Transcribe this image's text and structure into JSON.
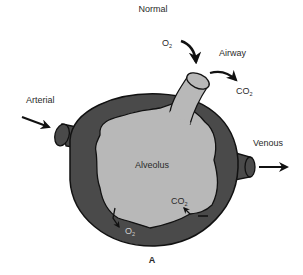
{
  "diagram": {
    "title": "Normal",
    "panel_label": "A",
    "colors": {
      "capillary": "#4a4a4a",
      "alveolus": "#b8b8b8",
      "outline": "#111111",
      "text": "#2a2a2a",
      "background": "#ffffff"
    },
    "labels": {
      "airway": "Airway",
      "arterial": "Arterial",
      "venous": "Venous",
      "alveolus": "Alveolus",
      "o2_in": "O",
      "o2_in_sub": "2",
      "co2_out": "CO",
      "co2_out_sub": "2",
      "co2_diffusion": "CO",
      "co2_diffusion_sub": "2",
      "o2_diffusion": "O",
      "o2_diffusion_sub": "2"
    }
  }
}
